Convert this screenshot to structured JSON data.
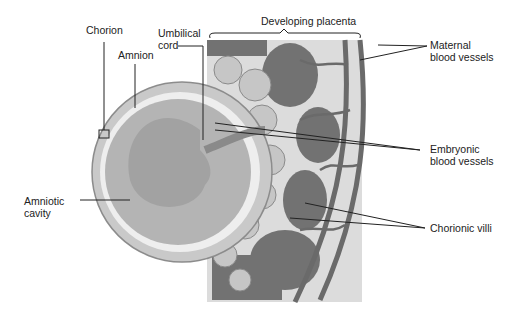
{
  "diagram": {
    "labels": {
      "chorion": "Chorion",
      "amnion": "Amnion",
      "umbilical_cord": "Umbilical\ncord",
      "developing_placenta": "Developing placenta",
      "maternal_blood_vessels": "Maternal\nblood vessels",
      "embryonic_blood_vessels": "Embryonic\nblood vessels",
      "amniotic_cavity": "Amniotic\ncavity",
      "chorionic_villi": "Chorionic villi"
    },
    "colors": {
      "placenta_bg": "#d8d8d8",
      "maternal_tissue": "#6e6e6e",
      "villi": "#c4c4c4",
      "embryo": "#a8a8a8",
      "amnion_light": "#eeeeee"
    }
  }
}
